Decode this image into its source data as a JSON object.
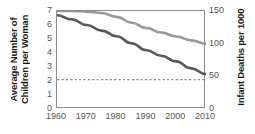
{
  "chart_data": {
    "type": "line",
    "title": "",
    "xlabel": "",
    "x": [
      1960,
      1965,
      1970,
      1975,
      1980,
      1985,
      1990,
      1995,
      2000,
      2005,
      2010
    ],
    "xlim": [
      1960,
      2010
    ],
    "xticks": [
      "1960",
      "1970",
      "1980",
      "1990",
      "2000",
      "2010"
    ],
    "grid": false,
    "legend": "none",
    "axes": {
      "left": {
        "label": "Average Number of Children per Woman",
        "label_line1": "Average Number of",
        "label_line2": "Children per Woman",
        "ticks": [
          "7",
          "6",
          "5",
          "4",
          "3",
          "2",
          "1",
          "0"
        ],
        "tick_values": [
          7,
          6,
          5,
          4,
          3,
          2,
          1,
          0
        ],
        "lim": [
          0,
          7
        ]
      },
      "right": {
        "label": "Infant Deaths per 1000",
        "ticks": [
          "150",
          "100",
          "50",
          "0"
        ],
        "tick_values": [
          150,
          100,
          50,
          0
        ],
        "lim": [
          0,
          150
        ]
      }
    },
    "series": [
      {
        "name": "Infant Deaths per 1000",
        "axis": "right",
        "color": "#9a9a9a",
        "style": "solid",
        "values": [
          150,
          150,
          149,
          147,
          141,
          132,
          124,
          117,
          111,
          105,
          100
        ]
      },
      {
        "name": "Average Number of Children per Woman",
        "axis": "left",
        "color": "#595959",
        "style": "solid",
        "values": [
          6.7,
          6.4,
          6.0,
          5.6,
          5.2,
          4.7,
          4.2,
          3.8,
          3.4,
          2.9,
          2.5
        ]
      },
      {
        "name": "Replacement level",
        "axis": "left",
        "color": "#8c8c8c",
        "style": "dashed",
        "constant": 2.1,
        "values": [
          2.1,
          2.1,
          2.1,
          2.1,
          2.1,
          2.1,
          2.1,
          2.1,
          2.1,
          2.1,
          2.1
        ]
      }
    ]
  }
}
